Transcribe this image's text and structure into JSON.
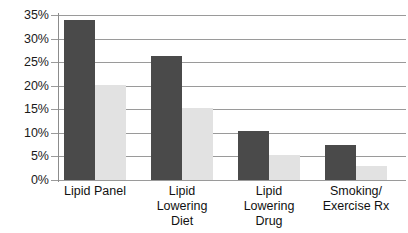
{
  "chart_data": {
    "type": "bar",
    "title": "",
    "subtitle": "",
    "xlabel": "",
    "ylabel": "",
    "ylim": [
      0,
      35
    ],
    "ytick_labels": [
      "0%",
      "5%",
      "10%",
      "15%",
      "20%",
      "25%",
      "30%",
      "35%"
    ],
    "ytick_values": [
      0,
      5,
      10,
      15,
      20,
      25,
      30,
      35
    ],
    "grid": true,
    "legend": "none",
    "categories": [
      "Lipid Panel",
      "Lipid Lowering Diet",
      "Lipid Lowering Drug",
      "Smoking/ Exercise Rx"
    ],
    "category_lines": [
      [
        "Lipid Panel"
      ],
      [
        "Lipid",
        "Lowering",
        "Diet"
      ],
      [
        "Lipid",
        "Lowering",
        "Drug"
      ],
      [
        "Smoking/",
        "Exercise Rx"
      ]
    ],
    "series": [
      {
        "name": "series-dark",
        "color": "#4a4a4a",
        "values": [
          34.0,
          26.3,
          10.3,
          7.4
        ]
      },
      {
        "name": "series-light",
        "color": "#e2e2e2",
        "values": [
          20.1,
          15.2,
          5.4,
          2.9
        ]
      }
    ]
  }
}
